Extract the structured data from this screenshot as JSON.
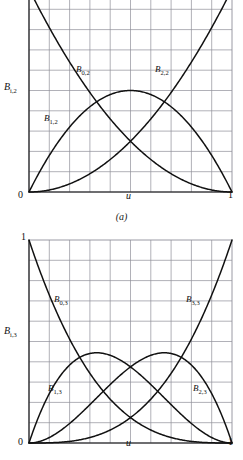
{
  "figure": {
    "panels": [
      {
        "id": "a",
        "caption": "(a)",
        "y_axis_label": "B",
        "y_axis_sub": "i,2",
        "x_axis_label": "u",
        "x_tick_min": "0",
        "x_tick_max": "1",
        "y_tick_max": "",
        "curve_labels": [
          {
            "name": "B",
            "sub": "0,2"
          },
          {
            "name": "B",
            "sub": "1,2"
          },
          {
            "name": "B",
            "sub": "2,2"
          }
        ]
      },
      {
        "id": "b",
        "caption": "(b)",
        "y_axis_label": "B",
        "y_axis_sub": "i,3",
        "x_axis_label": "u",
        "x_tick_min": "0",
        "x_tick_max": "1",
        "y_tick_max": "1",
        "curve_labels": [
          {
            "name": "B",
            "sub": "0,3"
          },
          {
            "name": "B",
            "sub": "1,3"
          },
          {
            "name": "B",
            "sub": "2,3"
          },
          {
            "name": "B",
            "sub": "3,3"
          }
        ]
      }
    ]
  },
  "colors": {
    "curve": "#111111",
    "grid": "#8f8f9a",
    "axis": "#111111",
    "background": "#ffffff"
  },
  "chart_data": [
    {
      "type": "line",
      "title": "",
      "subtitle": "(a)",
      "xlabel": "u",
      "ylabel": "B_{i,2}",
      "xlim": [
        0,
        1
      ],
      "ylim": [
        0,
        1
      ],
      "grid": true,
      "grid_divisions_x": 10,
      "grid_divisions_y": 10,
      "legend": "inline-annotations",
      "x": [
        0,
        0.1,
        0.2,
        0.3,
        0.4,
        0.5,
        0.6,
        0.7,
        0.8,
        0.9,
        1.0
      ],
      "series": [
        {
          "name": "B_{0,2}",
          "formula": "(1-u)^2",
          "values": [
            1.0,
            0.81,
            0.64,
            0.49,
            0.36,
            0.25,
            0.16,
            0.09,
            0.04,
            0.01,
            0.0
          ]
        },
        {
          "name": "B_{1,2}",
          "formula": "2u(1-u)",
          "values": [
            0.0,
            0.18,
            0.32,
            0.42,
            0.48,
            0.5,
            0.48,
            0.42,
            0.32,
            0.18,
            0.0
          ]
        },
        {
          "name": "B_{2,2}",
          "formula": "u^2",
          "values": [
            0.0,
            0.01,
            0.04,
            0.09,
            0.16,
            0.25,
            0.36,
            0.49,
            0.64,
            0.81,
            1.0
          ]
        }
      ],
      "note": "Top of plot area is cropped above the image edge; visible y range approx 0 to 1.05"
    },
    {
      "type": "line",
      "title": "",
      "subtitle": "(b)",
      "xlabel": "u",
      "ylabel": "B_{i,3}",
      "xlim": [
        0,
        1
      ],
      "ylim": [
        0,
        1
      ],
      "grid": true,
      "grid_divisions_x": 10,
      "grid_divisions_y": 10,
      "legend": "inline-annotations",
      "x": [
        0,
        0.1,
        0.2,
        0.3,
        0.4,
        0.5,
        0.6,
        0.7,
        0.8,
        0.9,
        1.0
      ],
      "series": [
        {
          "name": "B_{0,3}",
          "formula": "(1-u)^3",
          "values": [
            1.0,
            0.729,
            0.512,
            0.343,
            0.216,
            0.125,
            0.064,
            0.027,
            0.008,
            0.001,
            0.0
          ]
        },
        {
          "name": "B_{1,3}",
          "formula": "3u(1-u)^2",
          "values": [
            0.0,
            0.243,
            0.384,
            0.441,
            0.432,
            0.375,
            0.288,
            0.189,
            0.096,
            0.027,
            0.0
          ]
        },
        {
          "name": "B_{2,3}",
          "formula": "3u^2(1-u)",
          "values": [
            0.0,
            0.027,
            0.096,
            0.189,
            0.288,
            0.375,
            0.432,
            0.441,
            0.384,
            0.243,
            0.0
          ]
        },
        {
          "name": "B_{3,3}",
          "formula": "u^3",
          "values": [
            0.0,
            0.001,
            0.008,
            0.027,
            0.064,
            0.125,
            0.216,
            0.343,
            0.512,
            0.729,
            1.0
          ]
        }
      ]
    }
  ]
}
